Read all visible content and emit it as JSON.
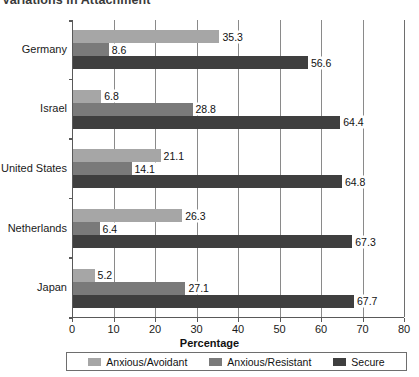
{
  "chart_data": {
    "type": "bar",
    "orientation": "horizontal",
    "title": "Variations in Attachment",
    "xlabel": "Percentage",
    "ylabel": "",
    "xlim": [
      0,
      80
    ],
    "xticks": [
      0,
      10,
      20,
      30,
      40,
      50,
      60,
      70,
      80
    ],
    "grid": "vertical",
    "legend_position": "bottom",
    "categories": [
      "Germany",
      "Israel",
      "United States",
      "Netherlands",
      "Japan"
    ],
    "series": [
      {
        "name": "Anxious/Avoidant",
        "color": "#a6a6a6",
        "values": [
          35.3,
          6.8,
          21.1,
          26.3,
          5.2
        ]
      },
      {
        "name": "Anxious/Resistant",
        "color": "#7a7a7a",
        "values": [
          8.6,
          28.8,
          14.1,
          6.4,
          27.1
        ]
      },
      {
        "name": "Secure",
        "color": "#3f3f3f",
        "values": [
          56.6,
          64.4,
          64.8,
          67.3,
          67.7
        ]
      }
    ]
  }
}
